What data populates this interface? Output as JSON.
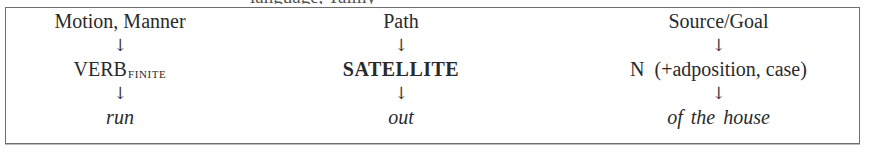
{
  "diagram": {
    "cutoff_heading_fragment": "language, Talmy",
    "columns": [
      {
        "label": "Motion, Manner",
        "arrow_top": "↓",
        "middle": "VERB",
        "middle_subscript": "FINITE",
        "arrow_bottom": "↓",
        "example": "run"
      },
      {
        "label": "Path",
        "arrow_top": "↓",
        "middle": "SATELLITE",
        "arrow_bottom": "↓",
        "example": "out"
      },
      {
        "label": "Source/Goal",
        "arrow_top": "↓",
        "middle_head": "N",
        "middle": "(+adposition, case)",
        "arrow_bottom": "↓",
        "example": "of the house"
      }
    ],
    "colors": {
      "text": "#2a2a2a",
      "border": "#6e6e6e",
      "background": "#ffffff"
    }
  }
}
